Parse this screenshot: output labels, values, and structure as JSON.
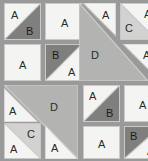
{
  "figure": {
    "name": "tile-arrangement-grid",
    "background_color": "#9a9a9a",
    "grid": {
      "columns": 4,
      "rows": 4,
      "cell_size_px": 37,
      "gap_px": 3
    },
    "palette": {
      "white": "#f4f4f2",
      "light_gray": "#d2d2d0",
      "mid_gray": "#b3b3b1",
      "dark_gray": "#7f7f7d",
      "seam": "#c9c9c7",
      "label": "#2a2a2a"
    },
    "labels": {
      "a": "A",
      "b": "B",
      "c": "C",
      "d": "D"
    }
  },
  "tiles": [
    {
      "id": "t1",
      "labels": [
        "A",
        "B"
      ],
      "colors": [
        "#f4f4f2",
        "#7f7f7d"
      ],
      "diagonal": "tl-br"
    },
    {
      "id": "t2",
      "labels": [
        "A"
      ],
      "colors": [
        "#f4f4f2"
      ],
      "diagonal": "none"
    },
    {
      "id": "t3",
      "labels": [
        "A"
      ],
      "colors": [
        "#f4f4f2",
        "#b3b3b1"
      ],
      "diagonal": "tl-br"
    },
    {
      "id": "t4",
      "labels": [
        "A"
      ],
      "colors": [
        "#f4f4f2",
        "#d2d2d0"
      ],
      "diagonal": "tl-br"
    },
    {
      "id": "t5",
      "labels": [
        "A"
      ],
      "colors": [
        "#f4f4f2"
      ],
      "diagonal": "none"
    },
    {
      "id": "t6",
      "labels": [
        "B",
        "A"
      ],
      "colors": [
        "#7f7f7d",
        "#f4f4f2"
      ],
      "diagonal": "bl-tr"
    },
    {
      "id": "t7",
      "labels": [
        "C",
        "A"
      ],
      "colors": [
        "#d2d2d0",
        "#f4f4f2"
      ],
      "diagonal": "bl-tr"
    },
    {
      "id": "t8",
      "labels": [
        "D"
      ],
      "colors": [
        "#b3b3b1"
      ],
      "diagonal": "block"
    },
    {
      "id": "t9",
      "labels": [
        "A"
      ],
      "colors": [
        "#f4f4f2",
        "#d2d2d0"
      ],
      "diagonal": "tl-br"
    },
    {
      "id": "t10",
      "labels": [
        "A"
      ],
      "colors": [
        "#f4f4f2",
        "#b3b3b1"
      ],
      "diagonal": "bl-tr"
    },
    {
      "id": "t11",
      "labels": [
        "D"
      ],
      "colors": [
        "#b3b3b1"
      ],
      "diagonal": "block"
    },
    {
      "id": "t12",
      "labels": [
        "A",
        "B"
      ],
      "colors": [
        "#f4f4f2",
        "#7f7f7d"
      ],
      "diagonal": "tl-br"
    },
    {
      "id": "t13",
      "labels": [
        "A"
      ],
      "colors": [
        "#f4f4f2"
      ],
      "diagonal": "none"
    },
    {
      "id": "t14",
      "labels": [
        "C",
        "A"
      ],
      "colors": [
        "#d2d2d0",
        "#f4f4f2"
      ],
      "diagonal": "bl-tr"
    },
    {
      "id": "t15",
      "labels": [
        "A"
      ],
      "colors": [
        "#f4f4f2",
        "#b3b3b1"
      ],
      "diagonal": "bl-tr"
    },
    {
      "id": "t16",
      "labels": [
        "A"
      ],
      "colors": [
        "#f4f4f2"
      ],
      "diagonal": "none"
    },
    {
      "id": "t17",
      "labels": [
        "B",
        "A"
      ],
      "colors": [
        "#7f7f7d",
        "#f4f4f2"
      ],
      "diagonal": "bl-tr"
    }
  ],
  "cells": {
    "r1c1": {
      "upper_left": "A",
      "lower_right": "B"
    },
    "r1c2": {
      "fill": "A"
    },
    "r1c3": {
      "upper_right": "A",
      "lower_left": "D-block"
    },
    "r1c4": {
      "upper_right": "A",
      "lower_left": "C"
    },
    "r2c1": {
      "fill": "A"
    },
    "r2c2": {
      "upper_left": "B",
      "lower_right": "A"
    },
    "r2c3": {
      "fill": "D-block"
    },
    "r2c4": {
      "upper_right": "A",
      "lower_left": "D-block"
    },
    "r3c1": {
      "upper_left": "A",
      "lower_right": "D-block"
    },
    "r3c2": {
      "fill": "D-block"
    },
    "r3c3": {
      "upper_left": "A",
      "lower_right": "B"
    },
    "r3c4": {
      "fill": "A"
    },
    "r4c1": {
      "upper_right": "C",
      "lower_left": "A"
    },
    "r4c2": {
      "upper_right": "D-block",
      "lower_left": "A"
    },
    "r4c3": {
      "fill": "A"
    },
    "r4c4": {
      "upper_left": "B",
      "lower_right": "A"
    }
  }
}
